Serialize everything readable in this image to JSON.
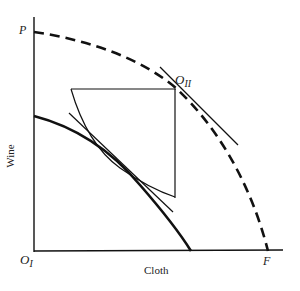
{
  "diagram": {
    "axes": {
      "x_label": "Cloth",
      "y_label": "Wine"
    },
    "points": {
      "origin_1": {
        "main": "O",
        "sub": "I"
      },
      "origin_2": {
        "main": "O",
        "sub": "II"
      },
      "p": "P",
      "f": "F"
    },
    "curves": [
      {
        "name": "world-ppf",
        "style": "dashed",
        "from": "P",
        "to": "F"
      },
      {
        "name": "country-1-ppf",
        "style": "solid-thick"
      },
      {
        "name": "country-2-ppf-inverted",
        "style": "solid-thin",
        "origin": "O_II"
      },
      {
        "name": "tangent-at-o2",
        "style": "solid-thin"
      },
      {
        "name": "common-tangent",
        "style": "solid-thin"
      }
    ],
    "colors": {
      "ink": "#111111",
      "background": "#ffffff"
    }
  }
}
